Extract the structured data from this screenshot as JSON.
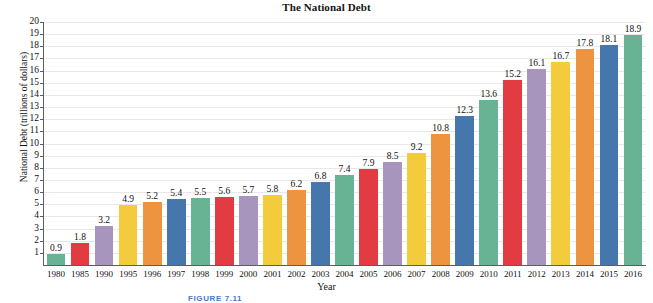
{
  "chart_data": {
    "type": "bar",
    "title": "The National Debt",
    "xlabel": "Year",
    "ylabel": "National Debt (trillions of dollars)",
    "ylim": [
      0,
      20
    ],
    "ytick_step": 1,
    "grid": true,
    "legend": "none",
    "categories": [
      "1980",
      "1985",
      "1990",
      "1995",
      "1996",
      "1997",
      "1998",
      "1999",
      "2000",
      "2001",
      "2002",
      "2003",
      "2004",
      "2005",
      "2006",
      "2007",
      "2008",
      "2009",
      "2010",
      "2011",
      "2012",
      "2013",
      "2014",
      "2015",
      "2016"
    ],
    "values": [
      0.9,
      1.8,
      3.2,
      4.9,
      5.2,
      5.4,
      5.5,
      5.6,
      5.7,
      5.8,
      6.2,
      6.8,
      7.4,
      7.9,
      8.5,
      9.2,
      10.8,
      12.3,
      13.6,
      15.2,
      16.1,
      16.7,
      17.8,
      18.1,
      18.9
    ],
    "value_labels": [
      "0.9",
      "1.8",
      "3.2",
      "4.9",
      "5.2",
      "5.4",
      "5.5",
      "5.6",
      "5.7",
      "5.8",
      "6.2",
      "6.8",
      "7.4",
      "7.9",
      "8.5",
      "9.2",
      "10.8",
      "12.3",
      "13.6",
      "15.2",
      "16.1",
      "16.7",
      "17.8",
      "18.1",
      "18.9"
    ],
    "ytick_labels": [
      "20",
      "19",
      "18",
      "17",
      "16",
      "15",
      "14",
      "13",
      "12",
      "11",
      "10",
      "9",
      "8",
      "7",
      "6",
      "5",
      "4",
      "3",
      "2",
      "1"
    ],
    "palette": [
      "#68b394",
      "#e23c42",
      "#a795be",
      "#f3cb3c",
      "#ed9440",
      "#4577ad"
    ],
    "palette_cycle_length": 6
  },
  "caption": {
    "text": "FIGURE 7.11"
  },
  "colors": {
    "green": "#68b394",
    "red": "#e23c42",
    "purple": "#a795be",
    "yellow": "#f3cb3c",
    "orange": "#ed9440",
    "blue": "#4577ad",
    "axis": "#5d5d5d",
    "grid": "#e8e8ea",
    "text": "#111111",
    "caption": "#4a79c4"
  }
}
